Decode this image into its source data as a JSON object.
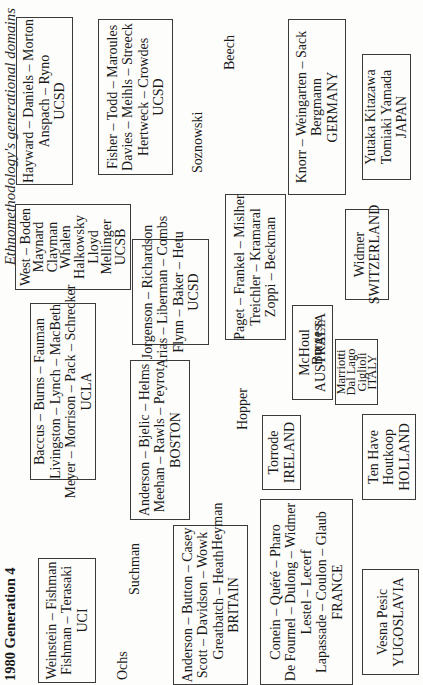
{
  "page": {
    "running_header": "Ethnomethodology's generational domains",
    "title": "1980 Generation 4",
    "orientation": "rotated 90° counterclockwise"
  },
  "groups": [
    {
      "id": "uci",
      "lines": [
        "Weinstein – Fishman",
        "Fishman – Terasaki",
        "UCI"
      ]
    },
    {
      "id": "ucla",
      "lines": [
        "Baccus – Burns – Fauman",
        "Livingston – Lynch – MacBeth",
        "Meyer – Morrison – Pack – Schrecker",
        "UCLA"
      ]
    },
    {
      "id": "ucsb",
      "lines": [
        "West – Boden",
        "Maynard",
        "Clayman",
        "Whalen",
        "Halkowsky",
        "Lloyd",
        "Mellinger",
        "UCSB"
      ]
    },
    {
      "id": "ucsd-1",
      "lines": [
        "Hayward – Daniels – Morton",
        "Anspach – Ryno",
        "UCSD"
      ]
    },
    {
      "id": "ucsd-2",
      "lines": [
        "Fisher – Todd – Maroules",
        "Davies – Meihls – Streeck",
        "Hertweck – Crowdes",
        "UCSD"
      ]
    },
    {
      "id": "ucsd-3",
      "lines": [
        "Jorgenson – Richardson",
        "Arias – Liberman – Combs",
        "Flynn – Baker – Hetu",
        "UCSD"
      ]
    },
    {
      "id": "boston",
      "lines": [
        "Anderson – Bjelic – Helms",
        "Meehan – Rawls – Peyrot",
        "BOSTON"
      ]
    },
    {
      "id": "britain",
      "lines": [
        "Anderson – Button – Casey",
        "Scott – Davidson – Wowk",
        "Greatbatch – Heath",
        "BRITAIN"
      ]
    },
    {
      "id": "misc",
      "lines": [
        "Paget – Frankel – Mislher",
        "Treichler – Kramaral",
        "Zoppi – Beckman"
      ]
    },
    {
      "id": "australia",
      "lines": [
        "McHoul",
        "AUSTRALIA"
      ]
    },
    {
      "id": "italy",
      "lines": [
        "Marriotti",
        "Dal Lago",
        "Giglioli",
        "ITALY"
      ]
    },
    {
      "id": "ireland",
      "lines": [
        "Torrode",
        "IRELAND"
      ]
    },
    {
      "id": "holland",
      "lines": [
        "Ten Have",
        "Houtkoop",
        "HOLLAND"
      ]
    },
    {
      "id": "france",
      "lines": [
        "Conein – Quéré – Pharo",
        "De Fournel – Dulong – Widmer",
        "Lestel – Lecerf",
        "Lapassade – Coulon – Glaub",
        "FRANCE"
      ]
    },
    {
      "id": "yugoslavia",
      "lines": [
        "Vesna Pesic",
        "YUGOSLAVIA"
      ]
    },
    {
      "id": "switzerland",
      "lines": [
        "Widmer",
        "SWITZERLAND"
      ]
    },
    {
      "id": "germany",
      "lines": [
        "Knorr – Weingarten – Sack",
        "Bergmann",
        "GERMANY"
      ]
    },
    {
      "id": "japan",
      "lines": [
        "Yutaka Kitazawa",
        "Tomiaki Yamada",
        "JAPAN"
      ]
    }
  ],
  "individuals": [
    "Ochs",
    "Suchman",
    "Heyman",
    "Hopper",
    "Burgess",
    "Soznowski",
    "Beech"
  ]
}
